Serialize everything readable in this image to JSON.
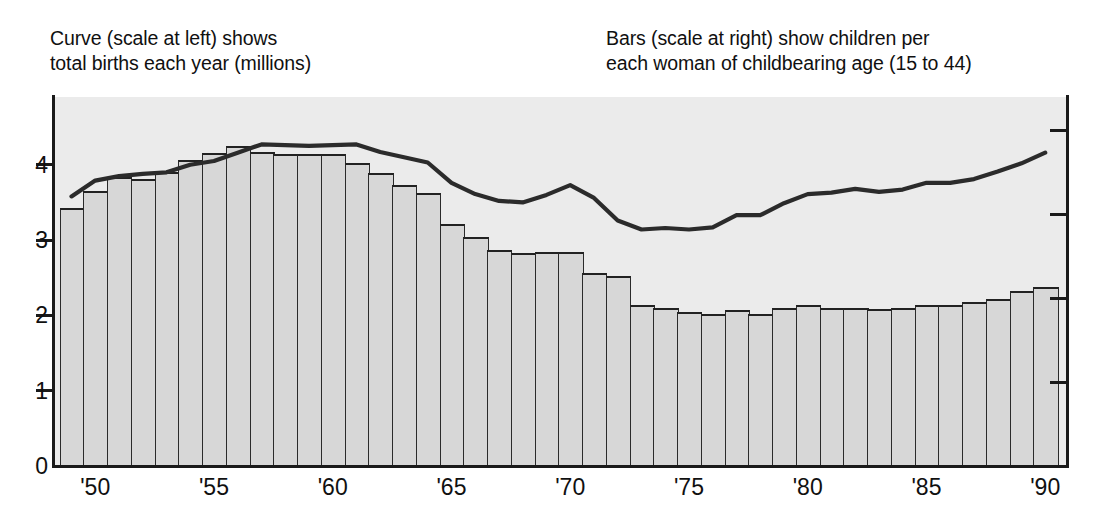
{
  "caption_left": "Curve (scale at left) shows\ntotal births each year (millions)",
  "caption_right": "Bars (scale at right) show children per\neach woman of childbearing age (15 to 44)",
  "colors": {
    "plot_background": "#ebebeb",
    "bar_fill": "#d7d7d7",
    "bar_stroke": "#2a2a2a",
    "curve": "#2b2b2b",
    "axis": "#1a1a1a",
    "text": "#101010"
  },
  "axes": {
    "y_left_ticks": [
      "0",
      "1",
      "2",
      "3",
      "4"
    ],
    "y_left_values": [
      0,
      1,
      2,
      3,
      4
    ],
    "y_right_tick_count": 4,
    "x_tick_labels": [
      "'50",
      "'55",
      "'60",
      "'65",
      "'70",
      "'75",
      "'80",
      "'85",
      "'90"
    ],
    "x_tick_years": [
      1950,
      1955,
      1960,
      1965,
      1970,
      1975,
      1980,
      1985,
      1990
    ]
  },
  "chart_data": {
    "type": "bar",
    "title": "",
    "subtitle": "",
    "xlabel": "",
    "ylabel": "",
    "grid": false,
    "legend_position": "above-plot",
    "x": [
      1949,
      1950,
      1951,
      1952,
      1953,
      1954,
      1955,
      1956,
      1957,
      1958,
      1959,
      1960,
      1961,
      1962,
      1963,
      1964,
      1965,
      1966,
      1967,
      1968,
      1969,
      1970,
      1971,
      1972,
      1973,
      1974,
      1975,
      1976,
      1977,
      1978,
      1979,
      1980,
      1981,
      1982,
      1983,
      1984,
      1985,
      1986,
      1987,
      1988,
      1989,
      1990
    ],
    "x_tick_labels": [
      "'50",
      "'55",
      "'60",
      "'65",
      "'70",
      "'75",
      "'80",
      "'85",
      "'90"
    ],
    "series": [
      {
        "name": "Bars (scale at right) show children per each woman of childbearing age (15 to 44)",
        "type": "bar",
        "axis": "right",
        "ylim": [
          0,
          4.4
        ],
        "values": [
          3.08,
          3.28,
          3.45,
          3.42,
          3.5,
          3.65,
          3.73,
          3.82,
          3.74,
          3.72,
          3.72,
          3.72,
          3.61,
          3.49,
          3.35,
          3.25,
          2.88,
          2.73,
          2.57,
          2.54,
          2.55,
          2.55,
          2.3,
          2.27,
          1.92,
          1.88,
          1.84,
          1.81,
          1.86,
          1.81,
          1.88,
          1.92,
          1.89,
          1.88,
          1.87,
          1.89,
          1.92,
          1.92,
          1.95,
          1.99,
          2.09,
          2.13
        ]
      },
      {
        "name": "Curve (scale at left) shows total births each year (millions)",
        "type": "line",
        "axis": "left",
        "ylim": [
          0,
          4.9
        ],
        "values": [
          3.58,
          3.79,
          3.85,
          3.88,
          3.9,
          4.0,
          4.05,
          4.16,
          4.27,
          4.26,
          4.25,
          4.26,
          4.27,
          4.17,
          4.1,
          4.03,
          3.76,
          3.61,
          3.52,
          3.5,
          3.6,
          3.73,
          3.56,
          3.26,
          3.14,
          3.16,
          3.14,
          3.17,
          3.33,
          3.33,
          3.49,
          3.61,
          3.63,
          3.68,
          3.64,
          3.67,
          3.76,
          3.76,
          3.81,
          3.91,
          4.02,
          4.16
        ]
      }
    ]
  }
}
